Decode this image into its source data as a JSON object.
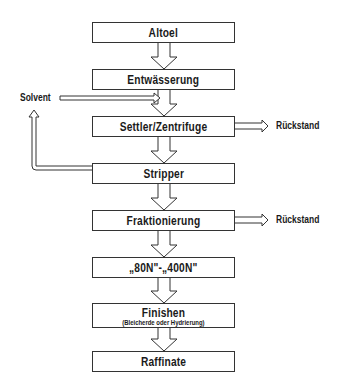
{
  "diagram": {
    "type": "process-flowchart",
    "nodes": [
      {
        "id": "altoel",
        "label": "Altoel"
      },
      {
        "id": "entwaesserung",
        "label": "Entwässerung"
      },
      {
        "id": "settler",
        "label": "Settler/Zentrifuge"
      },
      {
        "id": "stripper",
        "label": "Stripper"
      },
      {
        "id": "fraktionierung",
        "label": "Fraktionierung"
      },
      {
        "id": "grades",
        "label": "„80N\"-„400N\""
      },
      {
        "id": "finishen",
        "label": "Finishen",
        "sublabel": "(Bleicherde oder Hydrierung)"
      },
      {
        "id": "raffinate",
        "label": "Raffinate"
      }
    ],
    "side_labels": {
      "solvent": "Solvent",
      "rueckstand_1": "Rückstand",
      "rueckstand_2": "Rückstand"
    },
    "edges": [
      {
        "from": "altoel",
        "to": "entwaesserung"
      },
      {
        "from": "entwaesserung",
        "to": "settler"
      },
      {
        "from": "solvent",
        "to": "settler"
      },
      {
        "from": "settler",
        "to": "rueckstand_1"
      },
      {
        "from": "settler",
        "to": "stripper"
      },
      {
        "from": "stripper",
        "to": "solvent",
        "note": "recycle loop"
      },
      {
        "from": "stripper",
        "to": "fraktionierung"
      },
      {
        "from": "fraktionierung",
        "to": "rueckstand_2"
      },
      {
        "from": "fraktionierung",
        "to": "grades"
      },
      {
        "from": "grades",
        "to": "finishen"
      },
      {
        "from": "finishen",
        "to": "raffinate"
      }
    ],
    "colors": {
      "line": "#333333",
      "fill": "#ffffff",
      "text": "#1a1a1a"
    }
  }
}
